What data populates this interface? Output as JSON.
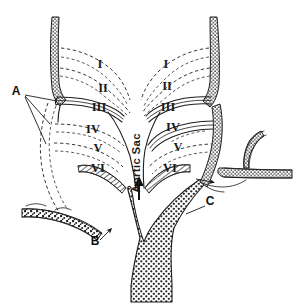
{
  "figure": {
    "name": "aortic-arch-derivatives-diagram",
    "type": "anatomical-line-diagram",
    "background_color": "#ffffff",
    "ink_color": "#1d1d1d"
  },
  "arch_labels": {
    "left": [
      {
        "id": "left-arch-1",
        "text": "I",
        "x": 100,
        "y": 68
      },
      {
        "id": "left-arch-2",
        "text": "II",
        "x": 102,
        "y": 92
      },
      {
        "id": "left-arch-3",
        "text": "III",
        "x": 96,
        "y": 110
      },
      {
        "id": "left-arch-4",
        "text": "IV",
        "x": 91,
        "y": 133
      },
      {
        "id": "left-arch-5",
        "text": "V",
        "x": 96,
        "y": 151
      },
      {
        "id": "left-arch-6",
        "text": "VI",
        "x": 95,
        "y": 171
      }
    ],
    "right": [
      {
        "id": "right-arch-1",
        "text": "I",
        "x": 163,
        "y": 68
      },
      {
        "id": "right-arch-2",
        "text": "II",
        "x": 163,
        "y": 90
      },
      {
        "id": "right-arch-3",
        "text": "III",
        "x": 163,
        "y": 110
      },
      {
        "id": "right-arch-4",
        "text": "IV",
        "x": 168,
        "y": 131
      },
      {
        "id": "right-arch-5",
        "text": "V",
        "x": 174,
        "y": 151
      },
      {
        "id": "right-arch-6",
        "text": "VI",
        "x": 166,
        "y": 172
      }
    ]
  },
  "point_labels": [
    {
      "id": "label-a",
      "text": "A",
      "x": 16,
      "y": 92
    },
    {
      "id": "label-b",
      "text": "B",
      "x": 96,
      "y": 242
    },
    {
      "id": "label-c",
      "text": "C",
      "x": 208,
      "y": 202
    }
  ],
  "aortic_sac": {
    "label": "Aortic Sac",
    "x": 140,
    "y": 160,
    "rotation_degrees": -90,
    "flow_arrow": "upward"
  },
  "legend_colors": {
    "ink": "#1d1d1d",
    "dashed_regressed": "#3a3a3a",
    "paper": "#ffffff"
  }
}
